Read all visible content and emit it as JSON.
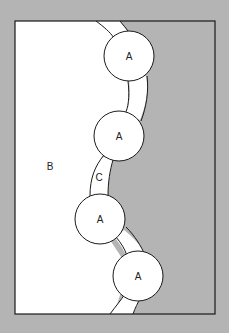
{
  "colors": {
    "background": "#b4b4b4",
    "frame_fill_gray": "#b4b4b4",
    "white_region": "#ffffff",
    "stroke": "#1a1a1a"
  },
  "labels": {
    "circle_1": "A",
    "circle_2": "A",
    "circle_3": "A",
    "circle_4": "A",
    "region_b": "B",
    "band_c": "C"
  }
}
